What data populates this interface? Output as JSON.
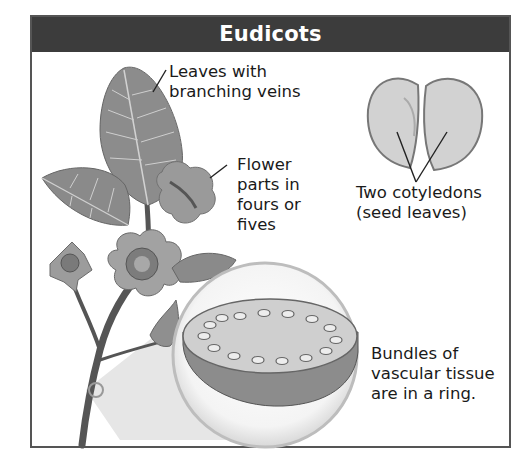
{
  "header": {
    "title": "Eudicots"
  },
  "labels": {
    "leaves": [
      "Leaves with",
      "branching veins"
    ],
    "flower": [
      "Flower",
      "parts in",
      "fours or",
      "fives"
    ],
    "cotyledons": [
      "Two cotyledons",
      "(seed leaves)"
    ],
    "vascular": [
      "Bundles of",
      "vascular tissue",
      "are in a ring."
    ]
  },
  "colors": {
    "header_bg": "#3c3c3c",
    "header_text": "#ffffff",
    "border": "#555555",
    "text": "#1a1a1a"
  }
}
